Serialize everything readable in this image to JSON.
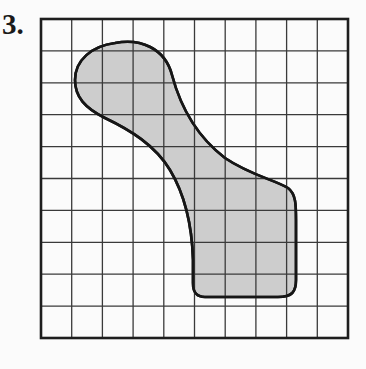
{
  "problem": {
    "number_label": "3."
  },
  "figure": {
    "type": "grid-with-shaded-region",
    "grid": {
      "columns": 10,
      "rows": 10,
      "left": 41,
      "top": 19,
      "right": 348,
      "bottom": 338
    },
    "colors": {
      "grid_line": "#3a3a3a",
      "border": "#1e1e1e",
      "shape_fill": "#cdcdcd",
      "shape_outline": "#161616",
      "background": "#fbfbfb"
    },
    "shape_path": "M 115 43 C 140 38 165 48 172 75 C 180 105 195 135 225 158 C 250 175 275 180 288 188 C 296 194 296 205 296 220 L 296 280 C 296 292 292 297 278 297 L 205 297 C 196 297 193 292 193 283 L 193 260 C 192 225 185 195 170 170 C 155 145 130 130 105 118 C 85 108 75 97 75 80 C 75 60 92 46 115 43 Z"
  }
}
